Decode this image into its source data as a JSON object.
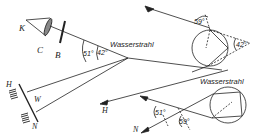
{
  "diagram": {
    "labels": {
      "K": "K",
      "C": "C",
      "B": "B",
      "H_left": "H",
      "W": "W",
      "N_left": "N",
      "H_right": "H",
      "N_right": "N"
    },
    "water_jet_label_left": "Wasserstrahl",
    "water_jet_label_right": "Wasserstrahl",
    "angles": {
      "left_outer": "51°",
      "left_inner": "42°",
      "top_right_incidence": "59°",
      "top_right_apex": "42°",
      "bottom_right_left": "51°",
      "bottom_right_right": "59°"
    },
    "colors": {
      "ink": "#222222",
      "background": "#ffffff"
    }
  }
}
